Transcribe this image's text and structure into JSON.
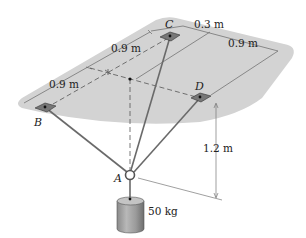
{
  "diagram": {
    "points": {
      "A": "A",
      "B": "B",
      "C": "C",
      "D": "D"
    },
    "dimensions": {
      "c_offset": "0.3 m",
      "right_width": "0.9 m",
      "upper_left": "0.9 m",
      "lower_left": "0.9 m",
      "height": "1.2 m"
    },
    "mass_label": "50 kg",
    "colors": {
      "plate": "#d2d2d2",
      "cable": "#6a6a6a",
      "dimension_line": "#555555",
      "cylinder": "#9a9a9a",
      "text": "#222222"
    }
  }
}
